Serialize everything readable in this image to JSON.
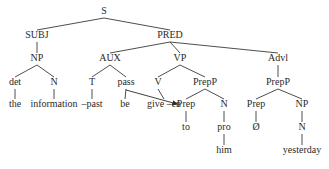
{
  "diagram": {
    "type": "syntax-tree",
    "nodes": [
      {
        "id": "S",
        "label": "S",
        "x": 104,
        "y": 12
      },
      {
        "id": "SUBJ",
        "label": "SUBJ",
        "x": 37,
        "y": 36
      },
      {
        "id": "PRED",
        "label": "PRED",
        "x": 170,
        "y": 36
      },
      {
        "id": "NP1",
        "label": "NP",
        "x": 37,
        "y": 59
      },
      {
        "id": "AUX",
        "label": "AUX",
        "x": 110,
        "y": 59
      },
      {
        "id": "VP",
        "label": "VP",
        "x": 180,
        "y": 59
      },
      {
        "id": "Advl",
        "label": "Advl",
        "x": 278,
        "y": 59
      },
      {
        "id": "det",
        "label": "det",
        "x": 15,
        "y": 83
      },
      {
        "id": "N1",
        "label": "N",
        "x": 54,
        "y": 83
      },
      {
        "id": "T",
        "label": "T",
        "x": 92,
        "y": 83
      },
      {
        "id": "pass",
        "label": "pass",
        "x": 126,
        "y": 83
      },
      {
        "id": "V",
        "label": "V",
        "x": 158,
        "y": 83
      },
      {
        "id": "PrepP1",
        "label": "PrepP",
        "x": 205,
        "y": 83
      },
      {
        "id": "PrepP2",
        "label": "PrepP",
        "x": 278,
        "y": 83
      },
      {
        "id": "the",
        "label": "the",
        "x": 15,
        "y": 105
      },
      {
        "id": "information",
        "label": "information",
        "x": 54,
        "y": 105
      },
      {
        "id": "past",
        "label": "–past",
        "x": 92,
        "y": 105
      },
      {
        "id": "be",
        "label": "be",
        "x": 125,
        "y": 105
      },
      {
        "id": "give",
        "label": "give –en",
        "x": 164,
        "y": 105
      },
      {
        "id": "Prep1",
        "label": "Prep",
        "x": 186,
        "y": 105
      },
      {
        "id": "N2",
        "label": "N",
        "x": 224,
        "y": 105
      },
      {
        "id": "Prep2",
        "label": "Prep",
        "x": 256,
        "y": 105
      },
      {
        "id": "NP2",
        "label": "NP",
        "x": 302,
        "y": 105
      },
      {
        "id": "to",
        "label": "to",
        "x": 186,
        "y": 128
      },
      {
        "id": "pro",
        "label": "pro",
        "x": 224,
        "y": 128
      },
      {
        "id": "null",
        "label": "Ø",
        "x": 256,
        "y": 128
      },
      {
        "id": "N3",
        "label": "N",
        "x": 302,
        "y": 128
      },
      {
        "id": "him",
        "label": "him",
        "x": 224,
        "y": 151
      },
      {
        "id": "yesterday",
        "label": "yesterday",
        "x": 302,
        "y": 151
      }
    ],
    "edges": [
      [
        "S",
        "SUBJ"
      ],
      [
        "S",
        "PRED"
      ],
      [
        "SUBJ",
        "NP1"
      ],
      [
        "PRED",
        "AUX"
      ],
      [
        "PRED",
        "VP"
      ],
      [
        "PRED",
        "Advl"
      ],
      [
        "NP1",
        "det"
      ],
      [
        "NP1",
        "N1"
      ],
      [
        "AUX",
        "T"
      ],
      [
        "AUX",
        "pass"
      ],
      [
        "VP",
        "V"
      ],
      [
        "VP",
        "PrepP1"
      ],
      [
        "Advl",
        "PrepP2"
      ],
      [
        "det",
        "the"
      ],
      [
        "N1",
        "information"
      ],
      [
        "T",
        "past"
      ],
      [
        "pass",
        "be"
      ],
      [
        "V",
        "give"
      ],
      [
        "PrepP1",
        "Prep1"
      ],
      [
        "PrepP1",
        "N2"
      ],
      [
        "PrepP2",
        "Prep2"
      ],
      [
        "PrepP2",
        "NP2"
      ],
      [
        "Prep1",
        "to"
      ],
      [
        "N2",
        "pro"
      ],
      [
        "Prep2",
        "null"
      ],
      [
        "NP2",
        "N3"
      ],
      [
        "pro",
        "him"
      ],
      [
        "N3",
        "yesterday"
      ]
    ],
    "arrows": [
      {
        "from": "pass",
        "to": "give",
        "label": "pass moves to -en",
        "x1": 126,
        "y1": 90,
        "x2": 177,
        "y2": 104
      }
    ]
  }
}
